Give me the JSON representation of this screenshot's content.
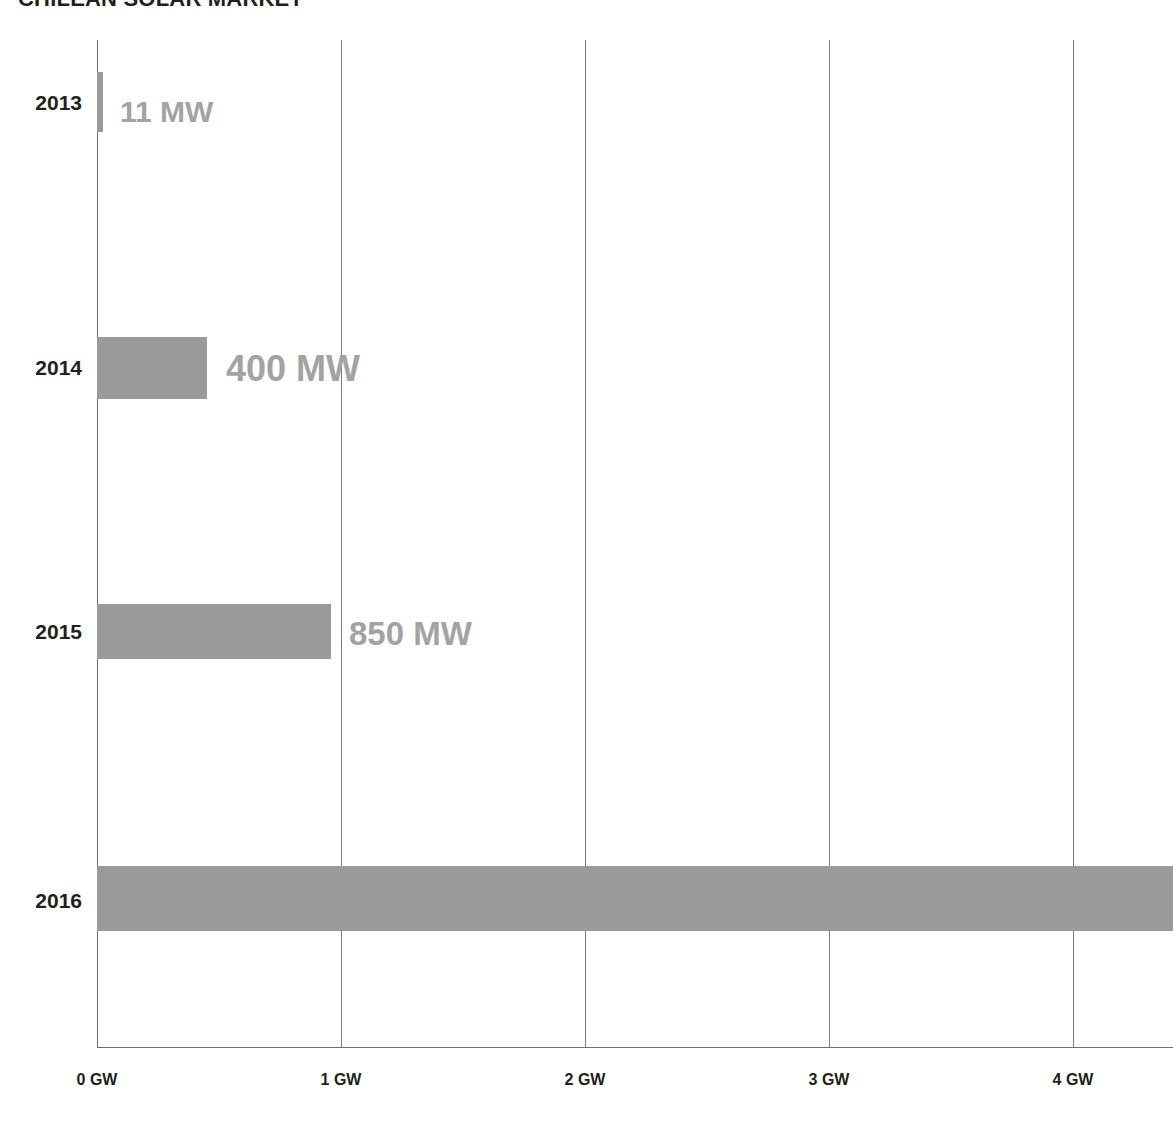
{
  "chart_data": {
    "type": "bar",
    "orientation": "horizontal",
    "title": "CHILEAN SOLAR MARKET",
    "xlabel": "",
    "ylabel": "",
    "categories": [
      "2013",
      "2014",
      "2015",
      "2016"
    ],
    "values": [
      11,
      400,
      850,
      4400
    ],
    "value_unit": "MW",
    "data_labels": [
      "11 MW",
      "400 MW",
      "850 MW",
      ""
    ],
    "xlim": [
      0,
      4.41
    ],
    "x_unit": "GW",
    "x_ticks": [
      {
        "value": 0,
        "label": "0 GW"
      },
      {
        "value": 1,
        "label": "1 GW"
      },
      {
        "value": 2,
        "label": "2 GW"
      },
      {
        "value": 3,
        "label": "3 GW"
      },
      {
        "value": 4,
        "label": "4 GW"
      }
    ],
    "grid": true,
    "legend": false,
    "colors": {
      "bar": "#9a9a9a",
      "data_label": "#a3a3a3",
      "category_label": "#231f20",
      "gridline": "#7d7d7d",
      "background": "#ffffff"
    }
  },
  "series": [
    {
      "year": "2013",
      "label": "11 MW",
      "value_mw": 11,
      "bar_width_px": 6,
      "bar_top_px": 72,
      "bar_height_px": 60,
      "label_left_px": 120,
      "label_top_px": 97,
      "label_font_px": 30,
      "year_top_px": 92
    },
    {
      "year": "2014",
      "label": "400 MW",
      "value_mw": 400,
      "bar_width_px": 110,
      "bar_top_px": 337,
      "bar_height_px": 62,
      "label_left_px": 226,
      "label_top_px": 351,
      "label_font_px": 36,
      "year_top_px": 357
    },
    {
      "year": "2015",
      "label": "850 MW",
      "value_mw": 850,
      "bar_width_px": 234,
      "bar_top_px": 604,
      "bar_height_px": 55,
      "label_left_px": 349,
      "label_top_px": 617,
      "label_font_px": 33,
      "year_top_px": 621
    },
    {
      "year": "2016",
      "label": "",
      "value_mw": 4400,
      "bar_width_px": 1076,
      "bar_top_px": 866,
      "bar_height_px": 65,
      "label_left_px": 0,
      "label_top_px": 0,
      "label_font_px": 33,
      "year_top_px": 890
    }
  ],
  "gridlines": [
    {
      "name": "0 GW",
      "left_px": 0,
      "is_axis": true
    },
    {
      "name": "1 GW",
      "left_px": 244,
      "is_axis": false
    },
    {
      "name": "2 GW",
      "left_px": 488,
      "is_axis": false
    },
    {
      "name": "3 GW",
      "left_px": 732,
      "is_axis": false
    },
    {
      "name": "4 GW",
      "left_px": 976,
      "is_axis": false
    }
  ],
  "x_tick_positions_px": [
    97,
    341,
    585,
    829,
    1073
  ]
}
